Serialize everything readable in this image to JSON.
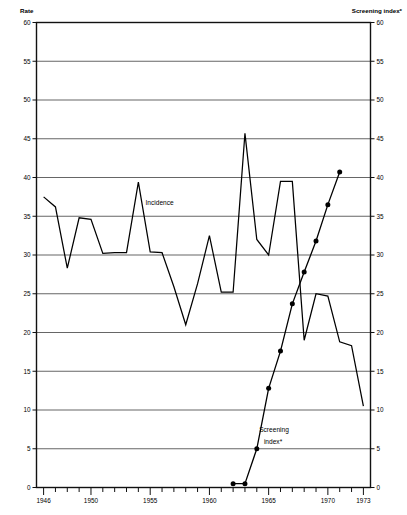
{
  "chart_data": {
    "type": "line",
    "title": "",
    "xlabel": "",
    "ylabel": "Rate",
    "y2label": "Screening index*",
    "xlim": [
      1945.4,
      1973.6
    ],
    "ylim": [
      0,
      60
    ],
    "y2lim": [
      0,
      60
    ],
    "grid": true,
    "legend": "inline-annotations",
    "y_ticks": [
      0,
      5,
      10,
      15,
      20,
      25,
      30,
      35,
      40,
      45,
      50,
      55,
      60
    ],
    "y_tick_labels": [
      "0",
      "5",
      "10",
      "15",
      "20",
      "25",
      "30",
      "35",
      "40",
      "45",
      "50",
      "55",
      "60"
    ],
    "y2_ticks": [
      0,
      5,
      10,
      15,
      20,
      25,
      30,
      35,
      40,
      45,
      50,
      55,
      60
    ],
    "y2_tick_labels": [
      "0",
      "5",
      "10",
      "15",
      "20",
      "25",
      "30",
      "35",
      "40",
      "45",
      "50",
      "55",
      "60"
    ],
    "x_ticks": [
      1946,
      1947,
      1948,
      1949,
      1950,
      1951,
      1952,
      1953,
      1954,
      1955,
      1956,
      1957,
      1958,
      1959,
      1960,
      1961,
      1962,
      1963,
      1964,
      1965,
      1966,
      1967,
      1968,
      1969,
      1970,
      1971,
      1972,
      1973
    ],
    "x_labeled_ticks": [
      1946,
      1950,
      1955,
      1960,
      1965,
      1970,
      1973
    ],
    "x_tick_labels": [
      "1946",
      "1950",
      "1955",
      "1960",
      "1965",
      "1970",
      "1973"
    ],
    "series": [
      {
        "name": "Incidence",
        "label": "Incidence",
        "color": "#000000",
        "markers": false,
        "x": [
          1946,
          1947,
          1948,
          1949,
          1950,
          1951,
          1952,
          1953,
          1954,
          1955,
          1956,
          1957,
          1958,
          1959,
          1960,
          1961,
          1962,
          1963,
          1964,
          1965,
          1966,
          1967,
          1968,
          1969,
          1970,
          1971,
          1972,
          1973
        ],
        "values": [
          37.5,
          36.2,
          28.3,
          34.8,
          34.6,
          30.2,
          30.3,
          30.3,
          39.4,
          30.4,
          30.3,
          25.9,
          21.0,
          26.3,
          32.5,
          25.2,
          25.2,
          45.7,
          32.0,
          30.0,
          39.5,
          39.5,
          19.0,
          25.0,
          24.7,
          18.8,
          18.3,
          10.5
        ]
      },
      {
        "name": "Screening index",
        "label": "Screening\nindex*",
        "color": "#000000",
        "markers": true,
        "x": [
          1962,
          1963,
          1964,
          1965,
          1966,
          1967,
          1968,
          1969,
          1970,
          1971
        ],
        "values": [
          0.5,
          0.5,
          5.0,
          12.8,
          17.6,
          23.7,
          27.8,
          31.8,
          36.5,
          40.7
        ]
      }
    ],
    "annotations": [
      {
        "name": "incidence-label",
        "text": "Incidence",
        "x": 1954.6,
        "y": 36.5
      },
      {
        "name": "screening-index-label-line1",
        "text": "Screening",
        "x": 1964.2,
        "y": 7.2
      },
      {
        "name": "screening-index-label-line2",
        "text": "index*",
        "x": 1964.6,
        "y": 5.6
      }
    ]
  },
  "axes": {
    "left_title": "Rate",
    "right_title": "Screening index*"
  },
  "caption": {
    "text": ""
  }
}
